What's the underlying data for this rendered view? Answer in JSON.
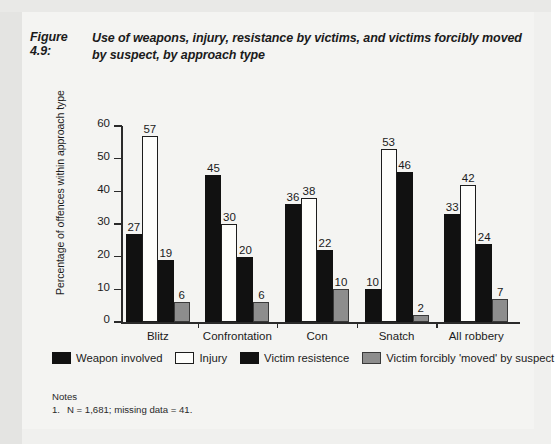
{
  "figure": {
    "label": "Figure 4.9:",
    "title": "Use of weapons, injury, resistance by victims, and victims forcibly moved by suspect, by approach type"
  },
  "notes": {
    "heading": "Notes",
    "items": [
      {
        "num": "1.",
        "text": "N = 1,681; missing data = 41."
      }
    ]
  },
  "chart_data": {
    "type": "bar",
    "title": "Use of weapons, injury, resistance by victims, and victims forcibly moved by suspect, by approach type",
    "xlabel": "",
    "ylabel": "Percentage of offences within approach type",
    "ylim": [
      0,
      60
    ],
    "yticks": [
      0,
      10,
      20,
      30,
      40,
      50,
      60
    ],
    "grid": false,
    "legend_position": "bottom",
    "categories": [
      "Blitz",
      "Confrontation",
      "Con",
      "Snatch",
      "All robbery"
    ],
    "series": [
      {
        "name": "Weapon involved",
        "color": "#111111",
        "values": [
          27,
          45,
          36,
          10,
          33
        ]
      },
      {
        "name": "Injury",
        "color": "#fdfdfb",
        "values": [
          57,
          30,
          38,
          53,
          42
        ]
      },
      {
        "name": "Victim resistence",
        "color": "#111111",
        "values": [
          19,
          20,
          22,
          46,
          24
        ]
      },
      {
        "name": "Victim forcibly 'moved' by suspect",
        "color": "#8d8d8d",
        "values": [
          6,
          6,
          10,
          2,
          7
        ]
      }
    ]
  }
}
